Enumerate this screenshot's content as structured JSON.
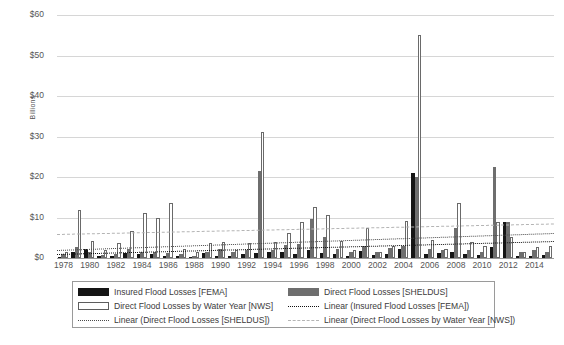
{
  "chart_data": {
    "type": "bar",
    "title": "",
    "xlabel": "",
    "ylabel": "Billions",
    "ylim": [
      0,
      60
    ],
    "yticks": [
      0,
      10,
      20,
      30,
      40,
      50,
      60
    ],
    "ytick_labels": [
      "$0",
      "$10",
      "$20",
      "$30",
      "$40",
      "$50",
      "$60"
    ],
    "grid": true,
    "legend_position": "bottom",
    "categories": [
      1978,
      1979,
      1980,
      1981,
      1982,
      1983,
      1984,
      1985,
      1986,
      1987,
      1988,
      1989,
      1990,
      1991,
      1992,
      1993,
      1994,
      1995,
      1996,
      1997,
      1998,
      1999,
      2000,
      2001,
      2002,
      2003,
      2004,
      2005,
      2006,
      2007,
      2008,
      2009,
      2010,
      2011,
      2012,
      2013,
      2014,
      2015
    ],
    "xtick_labels": [
      "1978",
      "1980",
      "1982",
      "1984",
      "1986",
      "1988",
      "1990",
      "1992",
      "1994",
      "1996",
      "1998",
      "2000",
      "2002",
      "2004",
      "2006",
      "2008",
      "2010",
      "2012",
      "2014"
    ],
    "series": [
      {
        "name": "Insured Flood Losses [FEMA]",
        "key": "fema",
        "color": "#151515",
        "values": [
          0.3,
          1.4,
          2.2,
          0.6,
          0.5,
          1.2,
          1.0,
          1.1,
          0.6,
          0.4,
          0.3,
          1.2,
          0.4,
          0.4,
          0.9,
          1.3,
          1.5,
          1.4,
          1.0,
          2.0,
          1.3,
          0.9,
          0.4,
          1.8,
          0.7,
          1.1,
          2.3,
          21.0,
          1.0,
          1.2,
          1.5,
          0.9,
          0.8,
          2.6,
          9.0,
          0.5,
          0.6,
          0.7
        ]
      },
      {
        "name": "Direct Flood Losses [SHELDUS]",
        "key": "sheldus",
        "color": "#6e6e6e",
        "values": [
          1.0,
          2.6,
          1.6,
          0.8,
          1.1,
          2.2,
          1.6,
          1.5,
          1.2,
          1.1,
          0.5,
          1.5,
          2.2,
          1.6,
          1.9,
          21.5,
          2.0,
          3.3,
          3.4,
          9.6,
          5.3,
          2.3,
          1.5,
          3.0,
          1.4,
          2.5,
          2.9,
          20.0,
          2.2,
          2.0,
          7.5,
          2.0,
          1.6,
          22.5,
          8.8,
          1.6,
          1.9,
          1.6
        ]
      },
      {
        "name": "Direct Flood Losses by Water Year [NWS]",
        "key": "nws",
        "color": "#ffffff",
        "values": [
          1.6,
          11.8,
          4.2,
          1.9,
          3.8,
          6.6,
          11.0,
          9.9,
          13.5,
          2.2,
          1.6,
          3.7,
          4.0,
          2.1,
          3.6,
          31.0,
          4.0,
          6.2,
          9.0,
          12.6,
          10.5,
          4.2,
          1.9,
          7.4,
          1.6,
          3.0,
          9.2,
          55.0,
          4.5,
          2.2,
          13.5,
          3.9,
          3.0,
          9.0,
          5.2,
          1.5,
          2.6,
          3.0
        ]
      }
    ],
    "trendlines": [
      {
        "name": "Linear (Insured Flood Losses [FEMA])",
        "key": "fema",
        "style": "dotted",
        "color": "#111111",
        "start_value": 0.9,
        "end_value": 4.1
      },
      {
        "name": "Linear (Direct Flood Losses [SHELDUS])",
        "key": "sheldus",
        "style": "dotted",
        "color": "#4a4a4a",
        "start_value": 2.0,
        "end_value": 6.2
      },
      {
        "name": "Linear (Direct Flood Losses by Water Year [NWS])",
        "key": "nws",
        "style": "dashed",
        "color": "#b4b4b4",
        "start_value": 6.0,
        "end_value": 8.6
      }
    ],
    "legend": [
      {
        "label": "Insured Flood Losses [FEMA]",
        "swatch": "swatch-fema"
      },
      {
        "label": "Direct Flood Losses [SHELDUS]",
        "swatch": "swatch-sheldus"
      },
      {
        "label": "Direct Flood Losses by Water Year [NWS]",
        "swatch": "swatch-nws"
      },
      {
        "label": "Linear (Insured Flood Losses [FEMA])",
        "swatch": "line-fema-dotted"
      },
      {
        "label": "Linear (Direct Flood Losses [SHELDUS])",
        "swatch": "line-sheldus-dotted"
      },
      {
        "label": "Linear (Direct Flood Losses by Water Year [NWS])",
        "swatch": "line-nws-dashed"
      }
    ]
  }
}
